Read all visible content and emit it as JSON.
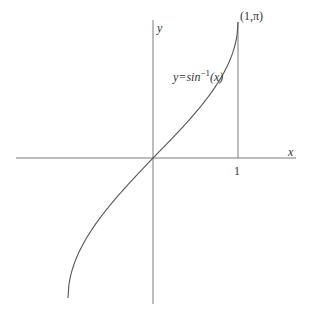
{
  "chart_data": {
    "type": "line",
    "title": "",
    "xlabel": "x",
    "ylabel": "y",
    "curve_label": "y=sin⁻¹(x)",
    "curve_label_parts": {
      "prefix": "y=",
      "func": "sin",
      "exp": "−1",
      "arg": "(x)"
    },
    "point_label": "(1,π)",
    "x_tick_labels": [
      "1"
    ],
    "xlim": [
      -1.8,
      1.7
    ],
    "ylim": [
      -3.2,
      3.2
    ],
    "grid": false,
    "legend": "none",
    "series": [
      {
        "name": "y=sin^-1(x)",
        "x": [
          -1.0,
          -0.9,
          -0.75,
          -0.5,
          -0.25,
          0,
          0.25,
          0.5,
          0.75,
          0.9,
          1.0
        ],
        "y": [
          -3.14,
          -2.24,
          -1.7,
          -1.05,
          -0.51,
          0,
          0.51,
          1.05,
          1.7,
          2.24,
          3.14
        ]
      }
    ],
    "annotations": [
      {
        "type": "vertical_line",
        "x": 1,
        "y_from": 0,
        "y_to": 3.14159
      },
      {
        "type": "point_label",
        "x": 1,
        "y": 3.14159,
        "text": "(1,π)"
      }
    ]
  },
  "colors": {
    "axis": "#777777",
    "curve": "#555555",
    "text": "#333333"
  }
}
